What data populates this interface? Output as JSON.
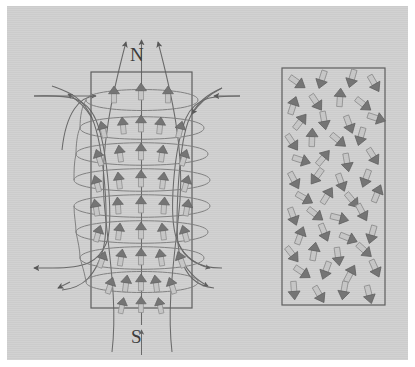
{
  "figure": {
    "type": "physics-diagram",
    "background_color": "#cfcfcf",
    "ink_color": "#5a5a5a",
    "arrow_fill": "#c2c2c2",
    "arrow_head_color": "#6e6e6e"
  },
  "labels": {
    "north_pole": "N",
    "south_pole": "S"
  },
  "left_panel": {
    "name": "magnetized-bar",
    "rect": {
      "x": 91,
      "y": 72,
      "w": 101,
      "h": 236
    },
    "description": "bar magnet with aligned magnetic domain arrows pointing from S to N",
    "domain_rows": 9,
    "domain_columns": 5,
    "field_lines": 7,
    "coil_turns": 9
  },
  "right_panel": {
    "name": "unmagnetized-bar",
    "rect": {
      "x": 282,
      "y": 68,
      "w": 103,
      "h": 237
    },
    "description": "unmagnetized material with randomly oriented magnetic domain arrows",
    "arrow_count": 48,
    "arrows": [
      {
        "x": 297,
        "y": 82,
        "a": 125
      },
      {
        "x": 322,
        "y": 79,
        "a": 198
      },
      {
        "x": 352,
        "y": 78,
        "a": 196
      },
      {
        "x": 374,
        "y": 83,
        "a": 150
      },
      {
        "x": 293,
        "y": 106,
        "a": 18
      },
      {
        "x": 316,
        "y": 102,
        "a": 146
      },
      {
        "x": 340,
        "y": 98,
        "a": 4
      },
      {
        "x": 363,
        "y": 104,
        "a": 128
      },
      {
        "x": 300,
        "y": 122,
        "a": 38
      },
      {
        "x": 324,
        "y": 120,
        "a": 170
      },
      {
        "x": 349,
        "y": 124,
        "a": 160
      },
      {
        "x": 376,
        "y": 118,
        "a": 108
      },
      {
        "x": 292,
        "y": 142,
        "a": 146
      },
      {
        "x": 312,
        "y": 138,
        "a": 2
      },
      {
        "x": 338,
        "y": 140,
        "a": 130
      },
      {
        "x": 361,
        "y": 136,
        "a": 196
      },
      {
        "x": 301,
        "y": 160,
        "a": 108
      },
      {
        "x": 323,
        "y": 158,
        "a": 40
      },
      {
        "x": 347,
        "y": 162,
        "a": 170
      },
      {
        "x": 373,
        "y": 156,
        "a": 148
      },
      {
        "x": 294,
        "y": 180,
        "a": 152
      },
      {
        "x": 317,
        "y": 176,
        "a": 216
      },
      {
        "x": 341,
        "y": 182,
        "a": 160
      },
      {
        "x": 366,
        "y": 178,
        "a": 200
      },
      {
        "x": 304,
        "y": 198,
        "a": 120
      },
      {
        "x": 327,
        "y": 196,
        "a": 32
      },
      {
        "x": 352,
        "y": 200,
        "a": 140
      },
      {
        "x": 377,
        "y": 194,
        "a": 22
      },
      {
        "x": 293,
        "y": 216,
        "a": 160
      },
      {
        "x": 315,
        "y": 214,
        "a": 128
      },
      {
        "x": 339,
        "y": 218,
        "a": 104
      },
      {
        "x": 362,
        "y": 212,
        "a": 152
      },
      {
        "x": 300,
        "y": 236,
        "a": 20
      },
      {
        "x": 324,
        "y": 232,
        "a": 158
      },
      {
        "x": 348,
        "y": 238,
        "a": 112
      },
      {
        "x": 372,
        "y": 234,
        "a": 196
      },
      {
        "x": 292,
        "y": 254,
        "a": 142
      },
      {
        "x": 314,
        "y": 252,
        "a": 10
      },
      {
        "x": 338,
        "y": 256,
        "a": 172
      },
      {
        "x": 364,
        "y": 250,
        "a": 132
      },
      {
        "x": 302,
        "y": 272,
        "a": 124
      },
      {
        "x": 326,
        "y": 270,
        "a": 200
      },
      {
        "x": 350,
        "y": 274,
        "a": 28
      },
      {
        "x": 375,
        "y": 268,
        "a": 156
      },
      {
        "x": 294,
        "y": 290,
        "a": 176
      },
      {
        "x": 319,
        "y": 294,
        "a": 150
      },
      {
        "x": 344,
        "y": 290,
        "a": 190
      },
      {
        "x": 369,
        "y": 294,
        "a": 166
      }
    ]
  }
}
